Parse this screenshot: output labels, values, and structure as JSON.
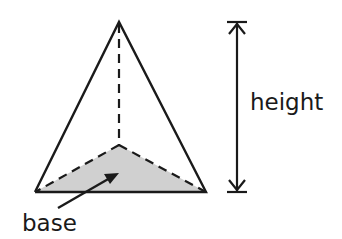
{
  "diagram": {
    "labels": {
      "height": "height",
      "base": "base"
    },
    "colors": {
      "stroke": "#1a1a1a",
      "base_fill": "#d0d0d0",
      "background": "#ffffff"
    }
  }
}
